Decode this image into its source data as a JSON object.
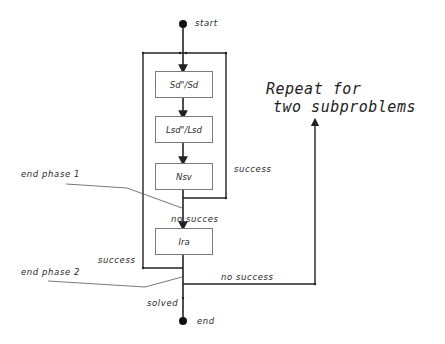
{
  "diagram": {
    "nodes": {
      "start": "start",
      "end": "end",
      "sd": "Sd\"/Sd",
      "lsd": "Lsd\"/Lsd",
      "nsv": "Nsv",
      "ira": "Ira"
    },
    "edge_labels": {
      "nsv_success": "success",
      "nsv_no_success": "no  succes",
      "ira_success": "success",
      "ira_no_success": "no success",
      "solved": "solved"
    },
    "annotations": {
      "end_phase_1": "end phase 1",
      "end_phase_2": "end phase 2",
      "repeat_line1": "Repeat for",
      "repeat_line2": "two subproblems"
    },
    "colors": {
      "line": "#222222",
      "box_border": "#7a7a7a",
      "annotation_line": "#555555"
    }
  }
}
